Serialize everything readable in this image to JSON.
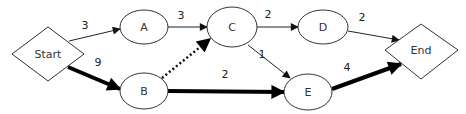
{
  "diagram": {
    "type": "network-path-diagram",
    "nodes": [
      {
        "id": "start",
        "label": "Start",
        "shape": "diamond"
      },
      {
        "id": "a",
        "label": "A",
        "shape": "ellipse"
      },
      {
        "id": "b",
        "label": "B",
        "shape": "ellipse"
      },
      {
        "id": "c",
        "label": "C",
        "shape": "ellipse"
      },
      {
        "id": "d",
        "label": "D",
        "shape": "ellipse"
      },
      {
        "id": "e",
        "label": "E",
        "shape": "ellipse"
      },
      {
        "id": "end",
        "label": "End",
        "shape": "diamond"
      }
    ],
    "edges": [
      {
        "from": "Start",
        "to": "A",
        "weight": "3",
        "style": "thin"
      },
      {
        "from": "Start",
        "to": "B",
        "weight": "9",
        "style": "bold"
      },
      {
        "from": "A",
        "to": "C",
        "weight": "3",
        "style": "thin"
      },
      {
        "from": "B",
        "to": "C",
        "weight": "",
        "style": "dotted"
      },
      {
        "from": "B",
        "to": "E",
        "weight": "2",
        "style": "bold"
      },
      {
        "from": "C",
        "to": "D",
        "weight": "2",
        "style": "thin"
      },
      {
        "from": "C",
        "to": "E",
        "weight": "1",
        "style": "thin"
      },
      {
        "from": "D",
        "to": "End",
        "weight": "2",
        "style": "thin"
      },
      {
        "from": "E",
        "to": "End",
        "weight": "4",
        "style": "bold"
      }
    ],
    "colors": {
      "stroke": "#333333",
      "bold_edge": "#000000",
      "background": "#ffffff"
    }
  }
}
